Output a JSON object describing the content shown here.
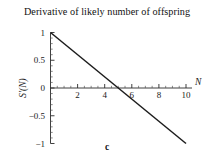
{
  "figure": {
    "background_color": "#ffffff",
    "caption_label": "c"
  },
  "chart_data": {
    "type": "line",
    "title": "Derivative of likely number of offspring",
    "xlabel": "N",
    "ylabel": "S'(N)",
    "xlim": [
      0,
      10.5
    ],
    "ylim": [
      -1,
      1
    ],
    "grid": false,
    "legend": false,
    "line_color": "#1c1c1c",
    "axis_color": "#2b2b2b",
    "x_zero_crossing": 5,
    "slope": -0.2,
    "intercept": 1,
    "series": [
      {
        "name": "S'(N)",
        "x": [
          0,
          10
        ],
        "y": [
          1,
          -1
        ]
      }
    ],
    "x_ticks": [
      {
        "value": 2,
        "label": "2"
      },
      {
        "value": 4,
        "label": "4"
      },
      {
        "value": 6,
        "label": "6"
      },
      {
        "value": 8,
        "label": "8"
      },
      {
        "value": 10,
        "label": "10"
      }
    ],
    "x_minor_ticks": [
      0.5,
      1,
      1.5,
      2.5,
      3,
      3.5,
      4.5,
      5,
      5.5,
      6.5,
      7,
      7.5,
      8.5,
      9,
      9.5
    ],
    "y_ticks": [
      {
        "value": 1,
        "label": "1"
      },
      {
        "value": 0.5,
        "label": "0.5"
      },
      {
        "value": 0,
        "label": "0"
      },
      {
        "value": -0.5,
        "label": "−0.5"
      },
      {
        "value": -1,
        "label": "−1"
      }
    ],
    "y_minor_ticks": [
      0.9,
      0.8,
      0.7,
      0.6,
      0.4,
      0.3,
      0.2,
      0.1,
      -0.1,
      -0.2,
      -0.3,
      -0.4,
      -0.6,
      -0.7,
      -0.8,
      -0.9
    ]
  }
}
